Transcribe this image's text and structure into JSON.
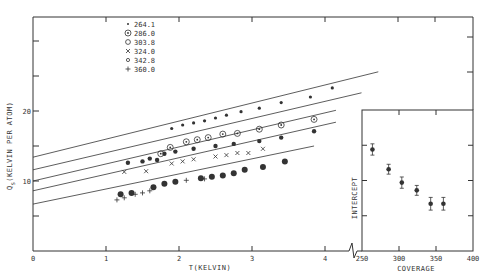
{
  "chart_data": [
    {
      "type": "scatter",
      "title": "",
      "xlabel": "T(KELVIN)",
      "ylabel": "Q_S (KELVIN PER ATOM)",
      "xlim": [
        0,
        4.3
      ],
      "ylim": [
        0,
        33
      ],
      "x_ticks": [
        "0",
        "1",
        "2",
        "3",
        "4"
      ],
      "y_tick_labels": [
        {
          "value": 10,
          "label": "10"
        },
        {
          "value": 20,
          "label": "20"
        }
      ],
      "y_ticks": [
        5,
        10,
        15,
        20,
        25,
        30
      ],
      "grid": false,
      "legend_position": "upper-left inside",
      "legend": [
        {
          "marker": "•",
          "label": "264.1"
        },
        {
          "marker": "⊛",
          "label": "286.0"
        },
        {
          "marker": "O",
          "label": "303.8"
        },
        {
          "marker": "X",
          "label": "324.0"
        },
        {
          "marker": "o",
          "label": "342.8"
        },
        {
          "marker": "+",
          "label": "360.0"
        }
      ],
      "fit_lines": [
        {
          "series": "264.1",
          "intercept": 13.4,
          "x_end": 4.73,
          "y_end": 25.6
        },
        {
          "series": "286.0",
          "intercept": 11.6,
          "x_end": 4.5,
          "y_end": 22.6
        },
        {
          "series": "303.8",
          "intercept": 10.0,
          "x_end": 4.15,
          "y_end": 20.1
        },
        {
          "series": "324.0",
          "intercept": 8.6,
          "x_end": 4.15,
          "y_end": 18.4
        },
        {
          "series": "342.8/360.0",
          "intercept": 6.7,
          "x_end": 3.85,
          "y_end": 15.0
        }
      ],
      "series": [
        {
          "name": "264.1",
          "x": [
            1.9,
            2.05,
            2.2,
            2.35,
            2.5,
            2.65,
            2.85,
            3.1,
            3.4,
            3.8,
            4.1
          ],
          "y": [
            17.5,
            18.0,
            18.3,
            18.6,
            19.0,
            19.4,
            19.9,
            20.4,
            21.2,
            22.0,
            23.3
          ]
        },
        {
          "name": "286.0",
          "x": [
            1.75,
            1.88,
            2.1,
            2.25,
            2.4,
            2.6,
            2.8,
            3.1,
            3.4,
            3.85
          ],
          "y": [
            13.9,
            14.8,
            15.6,
            15.9,
            16.2,
            16.7,
            16.8,
            17.4,
            18.0,
            18.8
          ]
        },
        {
          "name": "303.8",
          "x": [
            1.3,
            1.5,
            1.6,
            1.7,
            1.8,
            1.95,
            2.2,
            2.5,
            2.75,
            3.1,
            3.4,
            3.85
          ],
          "y": [
            12.6,
            12.8,
            13.2,
            13.0,
            13.9,
            14.2,
            14.6,
            15.0,
            15.3,
            15.7,
            16.2,
            17.1
          ]
        },
        {
          "name": "324.0",
          "x": [
            1.25,
            1.55,
            1.9,
            2.05,
            2.2,
            2.5,
            2.65,
            2.8,
            2.95,
            3.15
          ],
          "y": [
            11.3,
            11.4,
            12.5,
            12.8,
            13.1,
            13.5,
            13.7,
            14.0,
            14.0,
            14.6
          ]
        },
        {
          "name": "342.8",
          "x": [
            1.2,
            1.35,
            1.65,
            1.8,
            1.95,
            2.3,
            2.45,
            2.6,
            2.75,
            2.9,
            3.15,
            3.45
          ],
          "y": [
            8.1,
            8.3,
            9.1,
            9.6,
            9.9,
            10.4,
            10.6,
            10.8,
            11.1,
            11.6,
            12.0,
            12.8
          ]
        },
        {
          "name": "360.0",
          "x": [
            1.15,
            1.25,
            1.4,
            1.5,
            1.6,
            2.1,
            2.35
          ],
          "y": [
            7.3,
            7.6,
            8.1,
            8.3,
            8.6,
            10.1,
            10.3
          ]
        }
      ]
    },
    {
      "type": "scatter",
      "title": "",
      "xlabel": "COVERAGE",
      "ylabel": "INTERCEPT",
      "xlim": [
        250,
        400
      ],
      "ylim": [
        0,
        20
      ],
      "x_ticks": [
        "250",
        "300",
        "350",
        "400"
      ],
      "y_ticks": [
        5,
        10,
        15
      ],
      "grid": false,
      "series": [
        {
          "name": "intercept",
          "x": [
            264.1,
            286.0,
            303.8,
            324.0,
            342.8,
            360.0
          ],
          "y": [
            14.4,
            11.6,
            9.7,
            8.6,
            6.7,
            6.7
          ],
          "error": [
            0.8,
            0.7,
            0.8,
            0.7,
            0.9,
            0.9
          ]
        }
      ]
    }
  ],
  "main": {
    "xlabel": "T(KELVIN)",
    "ylabel_main": "Q",
    "ylabel_sub": "S",
    "ylabel_rest": "(KELVIN PER ATOM)",
    "x_tick_labels": [
      "0",
      "1",
      "2",
      "3",
      "4"
    ],
    "y_label_10": "10",
    "y_label_20": "20",
    "legend": [
      {
        "marker": "•",
        "label": "264.1"
      },
      {
        "marker": "⊛",
        "label": "286.0"
      },
      {
        "marker": "O",
        "label": "303.8"
      },
      {
        "marker": "X",
        "label": "324.0"
      },
      {
        "marker": "o",
        "label": "342.8"
      },
      {
        "marker": "+",
        "label": "360.0"
      }
    ]
  },
  "inset": {
    "xlabel": "COVERAGE",
    "ylabel": "INTERCEPT",
    "x_tick_labels": [
      "250",
      "300",
      "350",
      "400"
    ]
  }
}
